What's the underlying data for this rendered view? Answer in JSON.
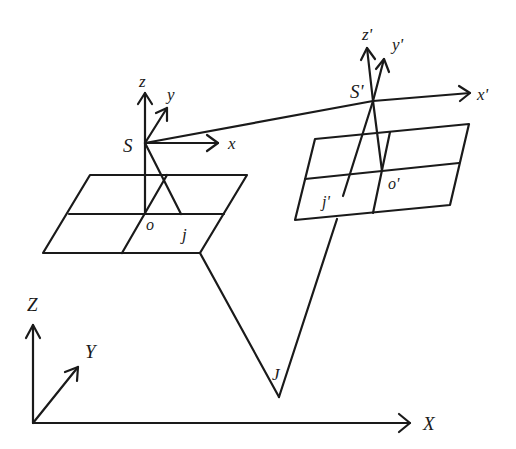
{
  "figure": {
    "type": "stereo-photogrammetry-geometry",
    "background": "#ffffff",
    "stroke_color": "#1a1a1a"
  },
  "left_camera": {
    "center_label": "S",
    "axes": {
      "x": "x",
      "y": "y",
      "z": "z"
    },
    "principal_point_label": "o",
    "image_point_label": "j"
  },
  "right_camera": {
    "center_label": "S'",
    "axes": {
      "x": "x'",
      "y": "y'",
      "z": "z'"
    },
    "principal_point_label": "o'",
    "image_point_label": "j'"
  },
  "ground_point": {
    "label": "J"
  },
  "world_axes": {
    "x": "X",
    "y": "Y",
    "z": "Z"
  }
}
